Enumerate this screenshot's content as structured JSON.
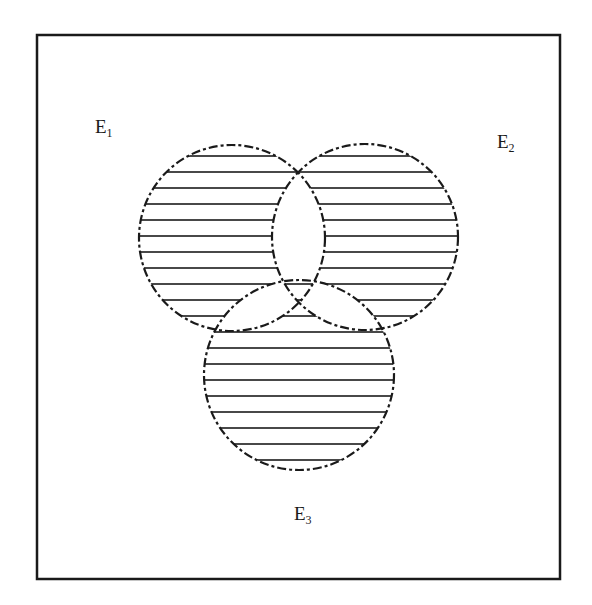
{
  "diagram": {
    "type": "venn",
    "universe": {
      "x": 37,
      "y": 35,
      "width": 523,
      "height": 544,
      "stroke": "#1a1a1a"
    },
    "sets": [
      {
        "id": "E1",
        "label": "E",
        "subscript": "1",
        "cx": 232,
        "cy": 238,
        "r": 93,
        "label_pos": {
          "x": 95,
          "y": 117
        }
      },
      {
        "id": "E2",
        "label": "E",
        "subscript": "2",
        "cx": 365,
        "cy": 237,
        "r": 93,
        "label_pos": {
          "x": 497,
          "y": 132
        }
      },
      {
        "id": "E3",
        "label": "E",
        "subscript": "3",
        "cx": 299,
        "cy": 375,
        "r": 95,
        "label_pos": {
          "x": 294,
          "y": 504
        }
      }
    ],
    "shaded_regions": [
      "E1 only",
      "E2 only",
      "E3 only",
      "E1∩E2∩E3"
    ],
    "unshaded_regions": [
      "E1∩E2 only",
      "E1∩E3 only",
      "E2∩E3 only",
      "outside"
    ],
    "hatch": {
      "style": "horizontal-lines",
      "spacing": 16,
      "color": "#1a1a1a"
    },
    "circle_stroke": {
      "style": "dash-dot",
      "color": "#1a1a1a"
    }
  }
}
